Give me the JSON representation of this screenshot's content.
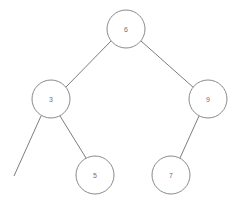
{
  "diagram": {
    "kind": "binary-search-tree",
    "canvas": {
      "width": 238,
      "height": 203,
      "background": "#ffffff"
    },
    "style": {
      "node_fill": "#ffffff",
      "node_stroke": "#8a8a8a",
      "node_radius": 19,
      "edge_color": "#7d7d7d",
      "edge_width": 1,
      "label_color": "#6f6f6f",
      "label_size": 7
    },
    "nodes": [
      {
        "id": "n6",
        "label": "6",
        "cx": 126,
        "cy": 29,
        "r": 19,
        "role": "root",
        "depth": 0
      },
      {
        "id": "n3",
        "label": "3",
        "cx": 51,
        "cy": 99,
        "r": 19,
        "role": "left-child",
        "depth": 1
      },
      {
        "id": "n9",
        "label": "9",
        "cx": 208,
        "cy": 99,
        "r": 19,
        "role": "right-child",
        "depth": 1
      },
      {
        "id": "n5",
        "label": "5",
        "cx": 95,
        "cy": 175,
        "r": 19,
        "role": "right-child",
        "depth": 2
      },
      {
        "id": "n7",
        "label": "7",
        "cx": 171,
        "cy": 175,
        "r": 19,
        "role": "left-child",
        "depth": 2
      }
    ],
    "edges": [
      {
        "id": "e-6-3",
        "from": "n6",
        "to": "n3",
        "x1": 111,
        "y1": 41,
        "x2": 66,
        "y2": 87,
        "label": "6-to-3"
      },
      {
        "id": "e-6-9",
        "from": "n6",
        "to": "n9",
        "x1": 141,
        "y1": 41,
        "x2": 194,
        "y2": 88,
        "label": "6-to-9"
      },
      {
        "id": "e-3-5",
        "from": "n3",
        "to": "n5",
        "x1": 60,
        "y1": 116,
        "x2": 86,
        "y2": 158,
        "label": "3-to-5"
      },
      {
        "id": "e-9-7",
        "from": "n9",
        "to": "n7",
        "x1": 199,
        "y1": 116,
        "x2": 180,
        "y2": 158,
        "label": "9-to-7"
      },
      {
        "id": "e-3-stub",
        "from": "n3",
        "to": null,
        "x1": 41,
        "y1": 116,
        "x2": 14,
        "y2": 176,
        "label": "3-to-empty-left"
      }
    ]
  }
}
